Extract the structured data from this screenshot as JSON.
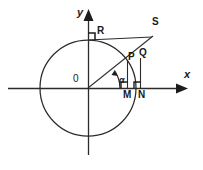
{
  "figure": {
    "background_color": "#ffffff",
    "stroke_color": "#262626",
    "labels": {
      "x_axis": "x",
      "y_axis": "y",
      "origin": "0",
      "angle": "α",
      "point_r": "R",
      "point_s": "S",
      "point_p": "P",
      "point_q": "Q",
      "point_m": "M",
      "point_n": "N"
    },
    "geometry": {
      "circle": {
        "cx": 88,
        "cy": 88,
        "r": 48
      },
      "x_axis_line": {
        "x1": 8,
        "y1": 88,
        "x2": 178,
        "y2": 88
      },
      "y_axis_line": {
        "x1": 88,
        "y1": 155,
        "x2": 88,
        "y2": 14
      },
      "angle_degrees": 35,
      "points": {
        "O": {
          "x": 88,
          "y": 88
        },
        "R": {
          "x": 88,
          "y": 40
        },
        "S": {
          "x": 152,
          "y": 36
        },
        "P": {
          "x": 127,
          "y": 61
        },
        "Q": {
          "x": 140,
          "y": 61
        },
        "M": {
          "x": 127,
          "y": 88
        },
        "N": {
          "x": 140,
          "y": 88
        }
      }
    }
  }
}
